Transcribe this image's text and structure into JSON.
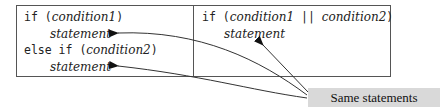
{
  "left_panel": {
    "line1": {
      "keyword": "if (",
      "cond": "condition1",
      "close": ")"
    },
    "line2": {
      "stmt": "statement"
    },
    "line3": {
      "keyword": "else if (",
      "cond": "condition2",
      "close": ")"
    },
    "line4": {
      "stmt": "statement"
    }
  },
  "right_panel": {
    "line1": {
      "keyword": "if (",
      "cond1": "condition1",
      "op": " || ",
      "cond2": "condition2",
      "close": ")"
    },
    "line2": {
      "stmt": "statement"
    }
  },
  "callout": {
    "label": "Same statements",
    "background": "#d9d9d9"
  }
}
